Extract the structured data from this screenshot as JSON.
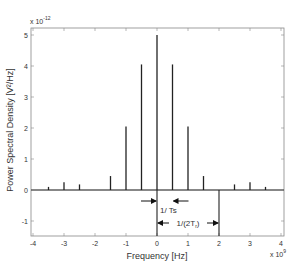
{
  "chart_data": {
    "type": "bar",
    "subtype": "stem",
    "title": "",
    "xlabel": "Frequency [Hz]",
    "ylabel": "Power Spectral Density [V²/Hz]",
    "x_multiplier": "x 10",
    "x_multiplier_exp": "9",
    "y_multiplier": "x 10",
    "y_multiplier_exp": "-12",
    "xlim": [
      -4.2,
      4.2
    ],
    "ylim": [
      -1.5,
      5.2
    ],
    "xticks": [
      -4,
      -3,
      -2,
      -1,
      0,
      1,
      2,
      3,
      4
    ],
    "yticks": [
      -1,
      0,
      1,
      2,
      3,
      4,
      5
    ],
    "grid": false,
    "x": [
      -3.5,
      -3,
      -2.5,
      -1.5,
      -1,
      -0.5,
      0,
      0.5,
      1,
      1.5,
      2.5,
      3,
      3.5
    ],
    "values": [
      0.1,
      0.25,
      0.18,
      0.45,
      2.05,
      4.05,
      5.0,
      4.05,
      2.05,
      0.45,
      0.18,
      0.25,
      0.1
    ],
    "annotations": [
      {
        "text": "1/ Ts",
        "type": "dimension",
        "from_x": 0,
        "to_x": 0.5
      },
      {
        "text": "1/(2T",
        "sub": "r",
        "suffix": ")",
        "type": "dimension",
        "from_x": 0,
        "to_x": 2
      }
    ],
    "reference_lines": [
      {
        "x": 0,
        "from_y": 0,
        "to_y": -1.5
      },
      {
        "x": 2,
        "from_y": 0,
        "to_y": -1.5
      }
    ]
  }
}
